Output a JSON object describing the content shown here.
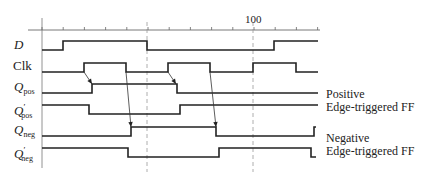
{
  "axis": {
    "tick_label_100": "100",
    "x_start": 42,
    "x_end": 318,
    "y": 30,
    "tick_spacing": 21.2,
    "dashed_lines_x": [
      147,
      253
    ]
  },
  "signals": [
    {
      "name": "D",
      "label_main": "D",
      "label_sub": "",
      "label_prime": "",
      "y_high": 41,
      "y_low": 50,
      "edges": [
        [
          42,
          "low"
        ],
        [
          63,
          "high"
        ],
        [
          147,
          "low"
        ],
        [
          274,
          "high"
        ],
        [
          318,
          "end"
        ]
      ]
    },
    {
      "name": "Clk",
      "label_main": "Clk",
      "label_sub": "",
      "label_prime": "",
      "y_high": 63,
      "y_low": 72,
      "edges": [
        [
          42,
          "low"
        ],
        [
          84,
          "high"
        ],
        [
          126,
          "low"
        ],
        [
          168,
          "high"
        ],
        [
          210,
          "low"
        ],
        [
          253,
          "high"
        ],
        [
          296,
          "low"
        ],
        [
          318,
          "end"
        ]
      ]
    },
    {
      "name": "Q_pos",
      "label_main": "Q",
      "label_sub": "pos",
      "label_prime": "",
      "y_high": 84,
      "y_low": 93,
      "edges": [
        [
          42,
          "low"
        ],
        [
          92,
          "high"
        ],
        [
          177,
          "low"
        ],
        [
          318,
          "end"
        ]
      ]
    },
    {
      "name": "Q'_pos",
      "label_main": "Q",
      "label_sub": "pos",
      "label_prime": "′",
      "y_high": 105,
      "y_low": 114,
      "edges": [
        [
          42,
          "high"
        ],
        [
          89,
          "low"
        ],
        [
          180,
          "high"
        ],
        [
          318,
          "end"
        ]
      ]
    },
    {
      "name": "Q_neg",
      "label_main": "Q",
      "label_sub": "neg",
      "label_prime": "",
      "y_high": 127,
      "y_low": 136,
      "edges": [
        [
          42,
          "low"
        ],
        [
          131,
          "high"
        ],
        [
          216,
          "low"
        ],
        [
          314,
          "high"
        ],
        [
          316,
          "end"
        ]
      ]
    },
    {
      "name": "Q'_neg",
      "label_main": "Q",
      "label_sub": "neg",
      "label_prime": "′",
      "y_high": 148,
      "y_low": 157,
      "edges": [
        [
          42,
          "high"
        ],
        [
          128,
          "low"
        ],
        [
          219,
          "high"
        ],
        [
          311,
          "low"
        ],
        [
          316,
          "end"
        ]
      ]
    }
  ],
  "arrows": [
    {
      "from": [
        84,
        72
      ],
      "to": [
        92,
        84
      ]
    },
    {
      "from": [
        126,
        72
      ],
      "to": [
        131,
        127
      ]
    },
    {
      "from": [
        168,
        72
      ],
      "to": [
        176,
        84
      ]
    },
    {
      "from": [
        210,
        72
      ],
      "to": [
        216,
        127
      ]
    }
  ],
  "legends": {
    "pos_line1": "Positive",
    "pos_line2": "Edge-triggered FF",
    "neg_line1": "Negative",
    "neg_line2": "Edge-triggered FF"
  }
}
